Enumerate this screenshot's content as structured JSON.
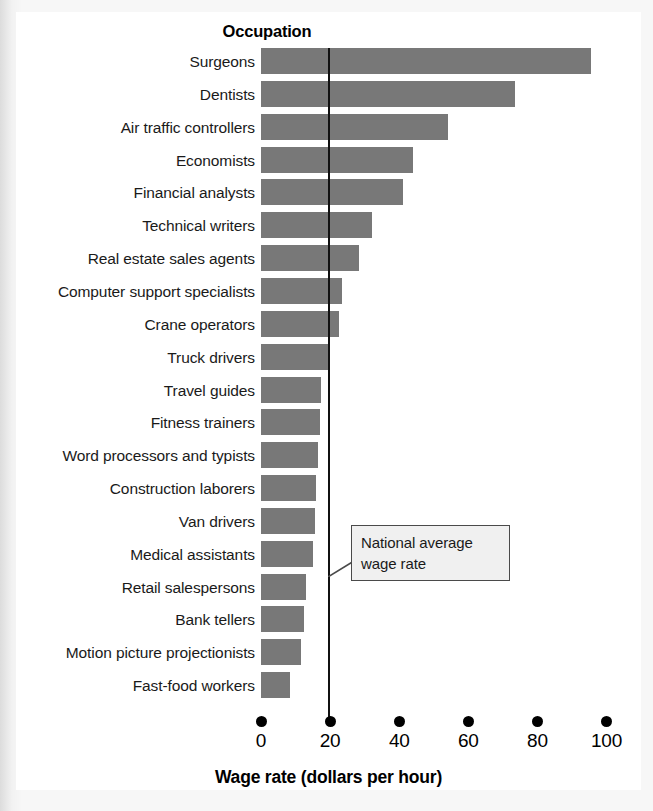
{
  "figure": {
    "column_header": "Occupation",
    "axis_title": "Wage rate (dollars per hour)",
    "callout_line1": "National average",
    "callout_line2": "wage rate",
    "bar_color": "#787878",
    "line_color": "#111111",
    "plate_color": "#ffffff"
  },
  "chart_data": {
    "type": "bar",
    "orientation": "horizontal",
    "title": "Occupation",
    "xlabel": "Wage rate (dollars per hour)",
    "ylabel": "Occupation",
    "xlim": [
      0,
      100
    ],
    "xticks": [
      0,
      20,
      40,
      60,
      80,
      100
    ],
    "xtick_labels": [
      "0",
      "20",
      "40",
      "60",
      "80",
      "100"
    ],
    "grid": false,
    "legend": null,
    "annotations": [
      {
        "text": "National average wage rate",
        "type": "reference-line-callout",
        "value": 19.5
      }
    ],
    "reference_line": {
      "label": "National average wage rate",
      "value": 19.5
    },
    "categories": [
      "Surgeons",
      "Dentists",
      "Air traffic controllers",
      "Economists",
      "Financial analysts",
      "Technical writers",
      "Real estate sales agents",
      "Computer support specialists",
      "Crane operators",
      "Truck drivers",
      "Travel guides",
      "Fitness trainers",
      "Word processors and typists",
      "Construction laborers",
      "Van drivers",
      "Medical assistants",
      "Retail salespersons",
      "Bank tellers",
      "Motion picture projectionists",
      "Fast-food workers"
    ],
    "values": [
      95.5,
      73.5,
      54.0,
      44.0,
      41.0,
      32.0,
      28.5,
      23.5,
      22.5,
      20.0,
      17.5,
      17.0,
      16.5,
      16.0,
      15.5,
      15.0,
      13.0,
      12.5,
      11.5,
      8.5
    ]
  }
}
